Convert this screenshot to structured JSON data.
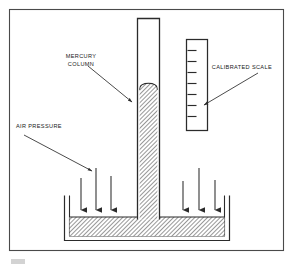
{
  "figure": {
    "background_color": "#ffffff",
    "frame": {
      "name": "outer-border-frame",
      "stroke_color": "#4a4a4a",
      "x": 9,
      "y": 9,
      "width": 275,
      "height": 242
    },
    "footer_artifact": {
      "visible": true,
      "color": "#b9b9b9"
    }
  },
  "labels": {
    "mercury_column": {
      "line1": "MERCURY",
      "line2": "COLUMN",
      "x": 81,
      "y": 58
    },
    "calibrated_scale": {
      "line1": "CALIBRATED SCALE",
      "x": 255,
      "y": 68
    },
    "air_pressure": {
      "line1": "AIR PRESSURE",
      "x": 16,
      "y": 128
    }
  },
  "leader_lines": [
    {
      "name": "leader-mercury-column",
      "x1": 88,
      "y1": 66,
      "x2": 133,
      "y2": 103,
      "arrow_at": "end"
    },
    {
      "name": "leader-calibrated-scale",
      "x1": 258,
      "y1": 73,
      "x2": 203,
      "y2": 105,
      "arrow_at": "end"
    },
    {
      "name": "leader-air-pressure",
      "x1": 24,
      "y1": 135,
      "x2": 93,
      "y2": 172,
      "arrow_at": "end"
    }
  ],
  "tube": {
    "name": "barometer-glass-tube",
    "left": 137,
    "right": 160,
    "top": 18,
    "bottom": 220,
    "wall_color": "#2b2b2b",
    "vacuum_fill": "#ffffff",
    "mercury_top_y": 84,
    "meniscus_shape": "rounded-dome"
  },
  "mercury": {
    "name": "mercury-fluid",
    "hatch_color": "#3a3a3a",
    "fill_color": "#ffffff",
    "hatch_angle_deg": 45,
    "reservoir_surface_y": 217,
    "column_top_y": 84
  },
  "scale": {
    "name": "calibrated-scale-box",
    "x": 186,
    "y": 39,
    "width": 22,
    "height": 92,
    "stroke_color": "#2b2b2b",
    "tick_count": 7,
    "tick_color": "#2b2b2b",
    "tick_positions_y": [
      50,
      61,
      72,
      83,
      94,
      105,
      116
    ],
    "tick_length": 9
  },
  "reservoir": {
    "name": "mercury-reservoir-basin",
    "outer_left": 64,
    "outer_right": 230,
    "top": 195,
    "bottom": 241,
    "wall_color": "#2b2b2b",
    "surface_y": 217
  },
  "air_pressure_arrows": {
    "name": "air-pressure-arrow-set",
    "color": "#2b2b2b",
    "direction": "down",
    "count": 6,
    "arrows": [
      {
        "x": 81,
        "y_start": 178,
        "y_end": 215
      },
      {
        "x": 96,
        "y_start": 168,
        "y_end": 215
      },
      {
        "x": 111,
        "y_start": 176,
        "y_end": 215
      },
      {
        "x": 183,
        "y_start": 181,
        "y_end": 215
      },
      {
        "x": 199,
        "y_start": 168,
        "y_end": 215
      },
      {
        "x": 215,
        "y_start": 180,
        "y_end": 215
      }
    ]
  }
}
